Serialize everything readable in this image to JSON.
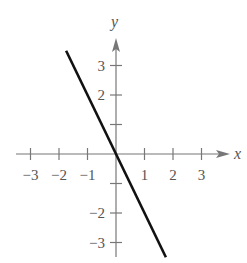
{
  "chart_data": {
    "type": "line",
    "title": "",
    "xlabel": "x",
    "ylabel": "y",
    "xlim": [
      -3.3,
      3.5
    ],
    "ylim": [
      -3.5,
      3.7
    ],
    "xticks": [
      -3,
      -2,
      -1,
      1,
      2,
      3
    ],
    "yticks": [
      -3,
      -2,
      -1,
      1,
      2,
      3
    ],
    "xtick_labels": [
      "−3",
      "−2",
      "−1",
      "1",
      "2",
      "3"
    ],
    "ytick_labels": [
      "−3",
      "−2",
      "",
      "",
      "2",
      "3"
    ],
    "grid": false,
    "legend": null,
    "series": [
      {
        "name": "y = -2x",
        "x": [
          -1.75,
          1.75
        ],
        "y": [
          3.5,
          -3.5
        ],
        "color": "#111111"
      }
    ]
  },
  "colors": {
    "axis": "#777777",
    "line": "#111111",
    "text": "#555555"
  }
}
